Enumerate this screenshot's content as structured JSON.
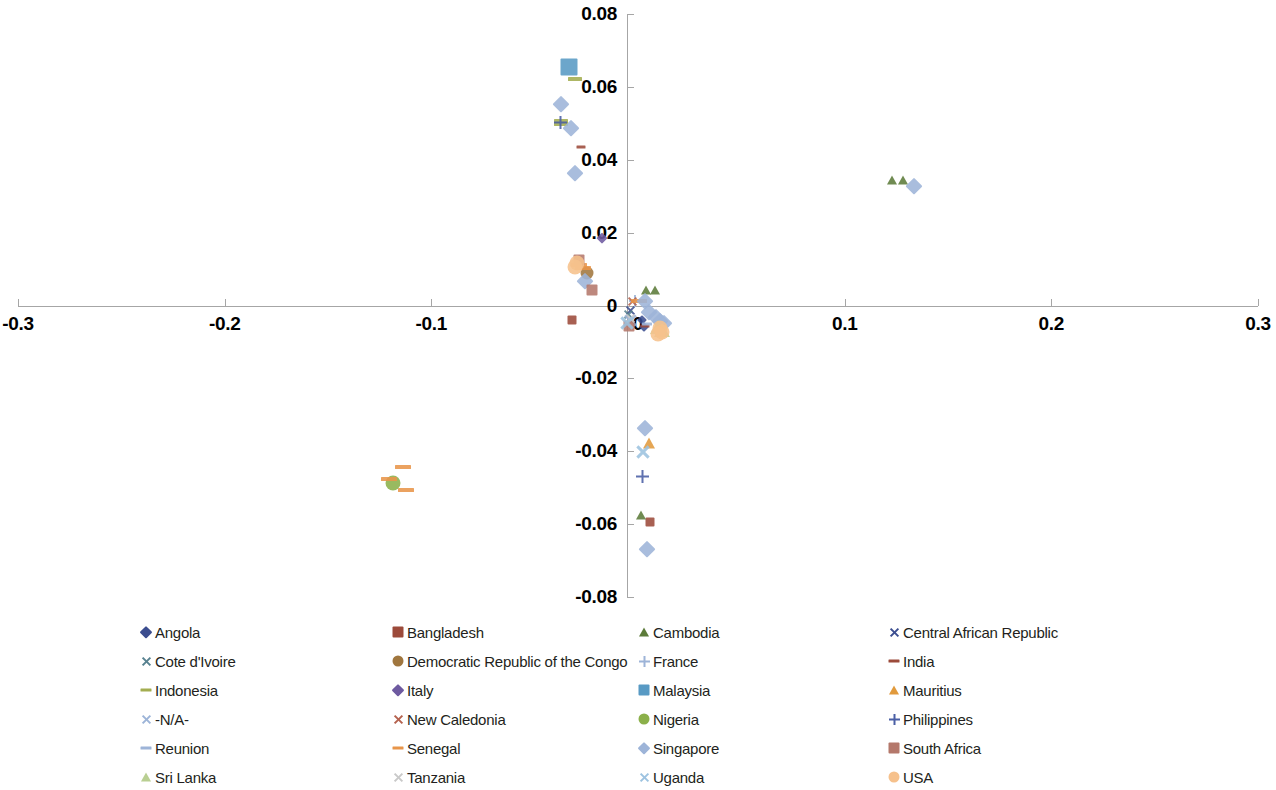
{
  "chart_data": {
    "type": "scatter",
    "title": "",
    "xlabel": "",
    "ylabel": "",
    "xlim": [
      -0.3,
      0.3
    ],
    "ylim": [
      -0.08,
      0.08
    ],
    "xticks": [
      "-0.3",
      "-0.2",
      "-0.1",
      "0",
      "0.1",
      "0.2",
      "0.3"
    ],
    "xtick_values": [
      -0.3,
      -0.2,
      -0.1,
      0,
      0.1,
      0.2,
      0.3
    ],
    "yticks": [
      "0.08",
      "0.06",
      "0.04",
      "0.02",
      "0",
      "-0.02",
      "-0.04",
      "-0.06",
      "-0.08"
    ],
    "ytick_values": [
      0.08,
      0.06,
      0.04,
      0.02,
      0,
      -0.02,
      -0.04,
      -0.06,
      -0.08
    ],
    "grid": false,
    "legend_position": "bottom",
    "legend_columns": 4,
    "axis_color": "#a6a6a6",
    "series": [
      {
        "name": "Angola",
        "marker": "diamond",
        "color": "#3b4d8f",
        "size": 9,
        "points": [
          [
            0.002,
            -0.004
          ],
          [
            0.003,
            -0.006
          ]
        ]
      },
      {
        "name": "Bangladesh",
        "marker": "square",
        "color": "#9c4a3a",
        "size": 9,
        "points": [
          [
            0.006,
            -0.0595
          ],
          [
            -0.032,
            -0.004
          ]
        ]
      },
      {
        "name": "Cambodia",
        "marker": "triangle",
        "color": "#5c7b3a",
        "size": 11,
        "points": [
          [
            0.123,
            0.0345
          ],
          [
            0.128,
            0.0345
          ],
          [
            0.004,
            0.0043
          ],
          [
            0.008,
            0.0043
          ],
          [
            0.0015,
            -0.0575
          ]
        ]
      },
      {
        "name": "Central African Republic",
        "marker": "x",
        "color": "#3b4d8f",
        "size": 11,
        "points": [
          [
            -0.0035,
            -0.0015
          ]
        ]
      },
      {
        "name": "Cote d'Ivoire",
        "marker": "x",
        "color": "#57818f",
        "size": 11,
        "points": [
          [
            -0.0045,
            -0.0025
          ]
        ]
      },
      {
        "name": "Democratic Republic of the Congo",
        "marker": "circle",
        "color": "#a0763e",
        "size": 13,
        "points": [
          [
            -0.0245,
            0.0089
          ]
        ]
      },
      {
        "name": "France",
        "marker": "plus",
        "color": "#9db4d8",
        "size": 12,
        "points": [
          [
            -0.0015,
            0.0012
          ]
        ]
      },
      {
        "name": "India",
        "marker": "dash",
        "color": "#9c4a3a",
        "size": 9,
        "points": [
          [
            -0.0275,
            0.0435
          ],
          [
            0.0035,
            -0.0055
          ]
        ]
      },
      {
        "name": "Indonesia",
        "marker": "dash",
        "color": "#a3ad50",
        "size": 14,
        "points": [
          [
            -0.0305,
            0.0622
          ],
          [
            -0.0375,
            0.0507
          ],
          [
            -0.0375,
            0.0498
          ]
        ]
      },
      {
        "name": "Italy",
        "marker": "diamond",
        "color": "#6e5aa0",
        "size": 10,
        "points": [
          [
            -0.0175,
            0.0185
          ]
        ]
      },
      {
        "name": "Malaysia",
        "marker": "square",
        "color": "#589ac4",
        "size": 17,
        "points": [
          [
            -0.0335,
            0.0655
          ]
        ]
      },
      {
        "name": "Mauritius",
        "marker": "triangle",
        "color": "#e19a3c",
        "size": 13,
        "points": [
          [
            0.0055,
            -0.0378
          ]
        ]
      },
      {
        "name": "-N/A-",
        "marker": "x",
        "color": "#9db4d8",
        "size": 15,
        "points": [
          [
            -0.0035,
            -0.0042
          ]
        ]
      },
      {
        "name": "New Caledonia",
        "marker": "x",
        "color": "#b4624e",
        "size": 11,
        "points": [
          [
            -0.0025,
            0.0012
          ]
        ]
      },
      {
        "name": "Nigeria",
        "marker": "circle",
        "color": "#8bb04a",
        "size": 15,
        "points": [
          [
            -0.1185,
            -0.0487
          ]
        ]
      },
      {
        "name": "Philippines",
        "marker": "plus",
        "color": "#4a5fa5",
        "size": 13,
        "points": [
          [
            -0.0375,
            0.0503
          ],
          [
            0.0022,
            -0.0468
          ]
        ]
      },
      {
        "name": "Reunion",
        "marker": "dash",
        "color": "#9db4d8",
        "size": 10,
        "points": [
          [
            0.0045,
            -0.0052
          ]
        ]
      },
      {
        "name": "Senegal",
        "marker": "dash",
        "color": "#e8954a",
        "size": 16,
        "points": [
          [
            -0.1135,
            -0.0443
          ],
          [
            -0.1205,
            -0.0477
          ],
          [
            -0.1125,
            -0.0505
          ],
          [
            -0.0285,
            0.0112
          ],
          [
            -0.0265,
            0.0102
          ],
          [
            0.0005,
            0.0012
          ]
        ]
      },
      {
        "name": "Singapore",
        "marker": "diamond",
        "color": "#9db4d8",
        "size": 15,
        "points": [
          [
            -0.0375,
            0.0552
          ],
          [
            -0.0325,
            0.0487
          ],
          [
            -0.0305,
            0.0365
          ],
          [
            -0.0255,
            0.0068
          ],
          [
            0.0035,
            0.0012
          ],
          [
            0.0055,
            -0.0018
          ],
          [
            0.0085,
            -0.0032
          ],
          [
            0.0105,
            -0.0042
          ],
          [
            0.0125,
            -0.0048
          ],
          [
            0.0035,
            -0.0335
          ],
          [
            0.0045,
            -0.0668
          ],
          [
            0.1335,
            0.0328
          ]
        ]
      },
      {
        "name": "South Africa",
        "marker": "square",
        "color": "#b4786b",
        "size": 11,
        "points": [
          [
            -0.0285,
            0.0125
          ],
          [
            -0.0225,
            0.0042
          ],
          [
            -0.0045,
            -0.0055
          ]
        ]
      },
      {
        "name": "Sri Lanka",
        "marker": "triangle",
        "color": "#b9cf92",
        "size": 16,
        "points": [
          [
            0.0095,
            -0.0058
          ],
          [
            0.0115,
            -0.0068
          ]
        ]
      },
      {
        "name": "Tanzania",
        "marker": "x",
        "color": "#c9c9c9",
        "size": 11,
        "points": [
          [
            -0.0035,
            -0.0035
          ]
        ]
      },
      {
        "name": "Uganda",
        "marker": "x",
        "color": "#9dc3e0",
        "size": 16,
        "points": [
          [
            -0.0055,
            -0.0048
          ],
          [
            0.0025,
            -0.0402
          ]
        ]
      },
      {
        "name": "USA",
        "marker": "circle",
        "color": "#f6c18c",
        "size": 15,
        "points": [
          [
            -0.0295,
            0.0118
          ],
          [
            -0.0305,
            0.0105
          ],
          [
            0.0105,
            -0.0062
          ],
          [
            0.0115,
            -0.0072
          ],
          [
            0.0095,
            -0.0078
          ]
        ]
      }
    ]
  },
  "legend": {
    "items": [
      {
        "label": "Angola",
        "marker": "diamond",
        "color": "#3b4d8f"
      },
      {
        "label": "Bangladesh",
        "marker": "square",
        "color": "#9c4a3a"
      },
      {
        "label": "Cambodia",
        "marker": "triangle",
        "color": "#5c7b3a"
      },
      {
        "label": "Central African Republic",
        "marker": "x",
        "color": "#3b4d8f"
      },
      {
        "label": "Cote d'Ivoire",
        "marker": "x",
        "color": "#57818f"
      },
      {
        "label": "Democratic Republic of the Congo",
        "marker": "circle",
        "color": "#a0763e"
      },
      {
        "label": "France",
        "marker": "plus",
        "color": "#9db4d8"
      },
      {
        "label": "India",
        "marker": "dash",
        "color": "#9c4a3a"
      },
      {
        "label": "Indonesia",
        "marker": "dash",
        "color": "#a3ad50"
      },
      {
        "label": "Italy",
        "marker": "diamond",
        "color": "#6e5aa0"
      },
      {
        "label": "Malaysia",
        "marker": "square",
        "color": "#589ac4"
      },
      {
        "label": "Mauritius",
        "marker": "triangle",
        "color": "#e19a3c"
      },
      {
        "label": "-N/A-",
        "marker": "x",
        "color": "#9db4d8"
      },
      {
        "label": "New Caledonia",
        "marker": "x",
        "color": "#b4624e"
      },
      {
        "label": "Nigeria",
        "marker": "circle",
        "color": "#8bb04a"
      },
      {
        "label": "Philippines",
        "marker": "plus",
        "color": "#4a5fa5"
      },
      {
        "label": "Reunion",
        "marker": "dash",
        "color": "#9db4d8"
      },
      {
        "label": "Senegal",
        "marker": "dash",
        "color": "#e8954a"
      },
      {
        "label": "Singapore",
        "marker": "diamond",
        "color": "#9db4d8"
      },
      {
        "label": "South Africa",
        "marker": "square",
        "color": "#b4786b"
      },
      {
        "label": "Sri Lanka",
        "marker": "triangle",
        "color": "#b9cf92"
      },
      {
        "label": "Tanzania",
        "marker": "x",
        "color": "#c9c9c9"
      },
      {
        "label": "Uganda",
        "marker": "x",
        "color": "#9dc3e0"
      },
      {
        "label": "USA",
        "marker": "circle",
        "color": "#f6c18c"
      }
    ]
  },
  "layout": {
    "plot": {
      "x0": 18,
      "x1": 1258,
      "y0": 14,
      "y1": 597,
      "origin_x": 627,
      "origin_y": 306
    },
    "legend": {
      "col_x": [
        138,
        390,
        636,
        886
      ],
      "row_y": [
        8,
        37,
        66,
        95,
        124,
        153
      ]
    }
  }
}
